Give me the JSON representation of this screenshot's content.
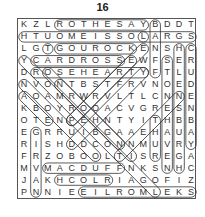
{
  "puzzle": {
    "number": "16",
    "rows": [
      "KZLROTHESAYBDDT",
      "HTUOMEISSOLARGS",
      "LGTGOUROCKENSHC",
      "YCARDROSSEWFSER",
      "DROSEHEARTYFTLU",
      "NVONTBSTFRVNOED",
      "AOAMRWRVLTLCNNE",
      "KBOYROOACVGRESN",
      "OTENPEHNTYITHBB",
      "EGRRUIBGAAEHAUA",
      "RISHDDCONNMUVRY",
      "FRZOBOOLTISREGA",
      "MVMACDUFFNKSNHC",
      "JAKHCOLRIAGOFIZ",
      "PNNIEEILROMLEKS"
    ],
    "found_words": [
      {
        "word": "ROTHESAY",
        "start": [
          0,
          3
        ],
        "end": [
          0,
          10
        ]
      },
      {
        "word": "LOSSIEMOUTH",
        "start": [
          1,
          10
        ],
        "end": [
          1,
          0
        ]
      },
      {
        "word": "LARGS",
        "start": [
          1,
          10
        ],
        "end": [
          1,
          14
        ]
      },
      {
        "word": "GOUROCK",
        "start": [
          2,
          3
        ],
        "end": [
          2,
          9
        ]
      },
      {
        "word": "CARDROSS",
        "start": [
          3,
          1
        ],
        "end": [
          3,
          8
        ]
      },
      {
        "word": "ROSEHEARTY",
        "start": [
          4,
          1
        ],
        "end": [
          4,
          10
        ]
      },
      {
        "word": "MACDUFF",
        "start": [
          12,
          2
        ],
        "end": [
          12,
          8
        ]
      },
      {
        "word": "HCOLR",
        "start": [
          13,
          3
        ],
        "end": [
          13,
          7
        ]
      },
      {
        "word": "SKELMORLIE",
        "start": [
          14,
          14
        ],
        "end": [
          14,
          5
        ]
      },
      {
        "word": "BANFF",
        "start": [
          0,
          11
        ],
        "end": [
          4,
          11
        ]
      },
      {
        "word": "HELENSBURGH",
        "start": [
          2,
          13
        ],
        "end": [
          12,
          13
        ]
      },
      {
        "word": "CRUDENBAY",
        "start": [
          2,
          14
        ],
        "end": [
          10,
          14
        ]
      },
      {
        "word": "STONEHAVEN",
        "start": [
          3,
          12
        ],
        "end": [
          12,
          12
        ]
      },
      {
        "word": "GIRVAN",
        "start": [
          9,
          1
        ],
        "end": [
          14,
          1
        ]
      },
      {
        "word": "TGOUROCK-diag",
        "start": [
          2,
          2
        ],
        "end": [
          2,
          2
        ]
      },
      {
        "word": "DIAG1",
        "start": [
          3,
          0
        ],
        "end": [
          14,
          11
        ]
      },
      {
        "word": "DIAG2",
        "start": [
          5,
          0
        ],
        "end": [
          11,
          6
        ]
      },
      {
        "word": "DIAG3",
        "start": [
          6,
          0
        ],
        "end": [
          8,
          2
        ]
      },
      {
        "word": "DIAG4",
        "start": [
          4,
          2
        ],
        "end": [
          10,
          8
        ]
      },
      {
        "word": "DIAG5",
        "start": [
          5,
          3
        ],
        "end": [
          11,
          9
        ]
      },
      {
        "word": "DIAG6",
        "start": [
          2,
          10
        ],
        "end": [
          8,
          4
        ]
      },
      {
        "word": "DIAG7",
        "start": [
          3,
          9
        ],
        "end": [
          8,
          4
        ]
      },
      {
        "word": "DIAG8",
        "start": [
          4,
          10
        ],
        "end": [
          10,
          4
        ]
      },
      {
        "word": "DIAG9",
        "start": [
          6,
          13
        ],
        "end": [
          11,
          8
        ]
      },
      {
        "word": "DIAG10",
        "start": [
          8,
          11
        ],
        "end": [
          11,
          11
        ]
      }
    ]
  }
}
